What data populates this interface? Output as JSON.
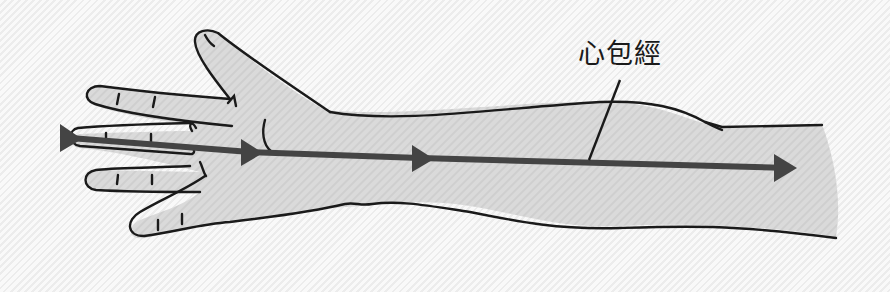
{
  "diagram": {
    "title": "心包經",
    "meridian_label": "心包經",
    "colors": {
      "background": "#f7f7f7",
      "skin_fill": "#d9d9d9",
      "outline": "#1a1a1a",
      "meridian_line": "#444444"
    },
    "arrows": [
      {
        "x": 62,
        "y": 138,
        "direction": "right"
      },
      {
        "x": 243,
        "y": 152,
        "direction": "right"
      },
      {
        "x": 412,
        "y": 158,
        "direction": "right"
      },
      {
        "x": 775,
        "y": 168,
        "direction": "right"
      }
    ]
  }
}
